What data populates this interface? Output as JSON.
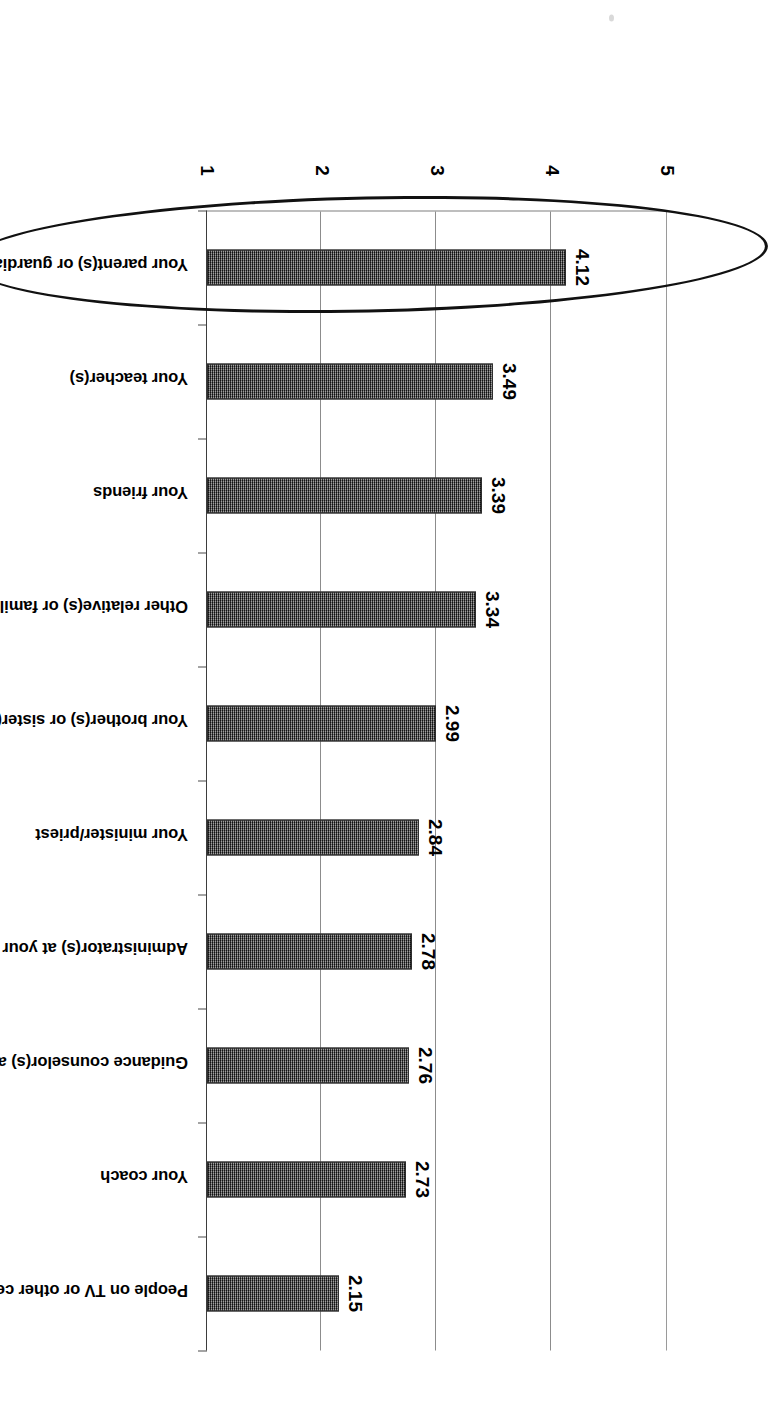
{
  "chart_data": {
    "type": "bar",
    "orientation": "vertical-rotated",
    "title": "",
    "xlabel": "",
    "ylabel": "",
    "ylim": [
      1,
      5
    ],
    "yticks": [
      "1",
      "2",
      "3",
      "4",
      "5"
    ],
    "grid": true,
    "legend": "none",
    "categories": [
      "Your parent(s) or guardian(s)",
      "Your teacher(s)",
      "Your friends",
      "Other relative(s) or family member(s)",
      "Your brother(s) or sister(s)",
      "Your minister/priest",
      "Administrator(s) at your school such as the principal",
      "Guidance counselor(s) at your school",
      "Your coach",
      "People on TV or other celebrities"
    ],
    "values": [
      4.12,
      3.49,
      3.39,
      3.34,
      2.99,
      2.84,
      2.78,
      2.76,
      2.73,
      2.15
    ],
    "value_labels": [
      "4.12",
      "3.49",
      "3.39",
      "3.34",
      "2.99",
      "2.84",
      "2.78",
      "2.76",
      "2.73",
      "2.15"
    ],
    "annotations": [
      {
        "name": "highlight-ellipse",
        "shape": "ellipse",
        "target_category": "Your parent(s) or guardian(s)",
        "color": "#111111"
      }
    ],
    "colors": {
      "bar_fill": "#4f4f4f",
      "bar_edge": "#2f2f2f",
      "gridline": "#8c8c8c",
      "axis": "#3d3d3d",
      "text": "#000000",
      "background": "#ffffff"
    }
  }
}
